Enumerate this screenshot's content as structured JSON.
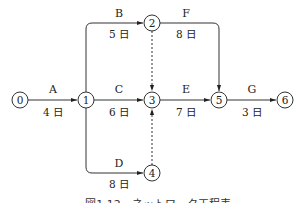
{
  "diagram": {
    "type": "arrow-network-schedule",
    "nodes": [
      {
        "id": "0",
        "label": "0",
        "x": 20,
        "y": 100
      },
      {
        "id": "1",
        "label": "1",
        "x": 86,
        "y": 100
      },
      {
        "id": "2",
        "label": "2",
        "x": 152,
        "y": 23
      },
      {
        "id": "3",
        "label": "3",
        "x": 152,
        "y": 100
      },
      {
        "id": "4",
        "label": "4",
        "x": 152,
        "y": 173
      },
      {
        "id": "5",
        "label": "5",
        "x": 219,
        "y": 100
      },
      {
        "id": "6",
        "label": "6",
        "x": 285,
        "y": 100
      }
    ],
    "activities": [
      {
        "name": "A",
        "duration": "4 日",
        "from": "0",
        "to": "1"
      },
      {
        "name": "B",
        "duration": "5 日",
        "from": "1",
        "to": "2"
      },
      {
        "name": "C",
        "duration": "6 日",
        "from": "1",
        "to": "3"
      },
      {
        "name": "D",
        "duration": "8 日",
        "from": "1",
        "to": "4"
      },
      {
        "name": "E",
        "duration": "7 日",
        "from": "3",
        "to": "5"
      },
      {
        "name": "F",
        "duration": "8 日",
        "from": "2",
        "to": "5"
      },
      {
        "name": "G",
        "duration": "3 日",
        "from": "5",
        "to": "6"
      }
    ],
    "dummies": [
      {
        "from": "2",
        "to": "3",
        "style": "dashed"
      },
      {
        "from": "4",
        "to": "3",
        "style": "dashed"
      }
    ],
    "caption": "図1.12　ネットワーク工程表"
  }
}
